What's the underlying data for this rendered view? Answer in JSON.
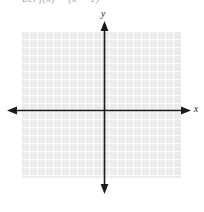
{
  "figure": {
    "name": "coordinate-plane-grid",
    "prompt_text": "Let f(x) = (x − 1)",
    "background_color": "#ffffff",
    "grid": {
      "fill_color": "#ebebeb",
      "line_color": "#fdfdfd",
      "cell_size_px": 8,
      "columns": 20,
      "rows": 18,
      "left_px": 22,
      "top_px": 32,
      "width_px": 159,
      "height_px": 146
    },
    "axes": {
      "color": "#1a1a1a",
      "origin": {
        "x_px": 104,
        "y_px": 110
      },
      "x_axis": {
        "label": "x",
        "start_px": 8,
        "end_px": 190,
        "y_px": 110,
        "arrow_left": true,
        "arrow_right": true
      },
      "y_axis": {
        "label": "y",
        "start_px": 22,
        "end_px": 193,
        "x_px": 104,
        "arrow_up": true,
        "arrow_down": true
      }
    }
  }
}
